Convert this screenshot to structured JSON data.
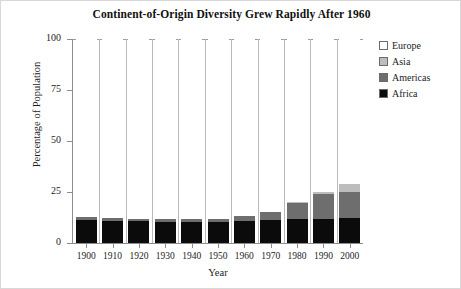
{
  "chart_data": {
    "type": "bar",
    "stacked": true,
    "title": "Continent-of-Origin Diversity Grew Rapidly After 1960",
    "xlabel": "Year",
    "ylabel": "Percentage of Population",
    "categories": [
      "1900",
      "1910",
      "1920",
      "1930",
      "1940",
      "1950",
      "1960",
      "1970",
      "1980",
      "1990",
      "2000"
    ],
    "ylim": [
      0,
      100
    ],
    "yticks": [
      0,
      25,
      50,
      75,
      100
    ],
    "ytick_labels": [
      "0",
      "25",
      "50",
      "75",
      "100"
    ],
    "grid": "vertical",
    "legend_position": "right",
    "series": [
      {
        "name": "Africa",
        "color": "#0b0b0b",
        "values": [
          11.5,
          11.0,
          10.7,
          10.5,
          10.5,
          10.5,
          11.0,
          11.5,
          12.0,
          12.0,
          12.5
        ]
      },
      {
        "name": "Americas",
        "color": "#6e6e6e",
        "values": [
          1.2,
          1.2,
          1.3,
          1.3,
          1.3,
          1.5,
          2.0,
          3.5,
          7.5,
          12.0,
          12.5
        ]
      },
      {
        "name": "Asia",
        "color": "#bdbdbd",
        "values": [
          0.0,
          0.0,
          0.0,
          0.0,
          0.0,
          0.0,
          0.0,
          0.0,
          0.5,
          1.0,
          4.0
        ]
      },
      {
        "name": "Europe",
        "color": "#ffffff",
        "values": [
          87.3,
          87.8,
          88.0,
          88.2,
          88.2,
          88.0,
          87.0,
          85.0,
          80.0,
          75.0,
          71.0
        ]
      }
    ],
    "totals_non_europe": [
      12.7,
      12.2,
      12.0,
      11.8,
      11.8,
      12.0,
      13.0,
      15.0,
      20.0,
      25.0,
      29.0
    ]
  },
  "legend": {
    "items": [
      {
        "label": "Europe",
        "color": "#ffffff"
      },
      {
        "label": "Asia",
        "color": "#bdbdbd"
      },
      {
        "label": "Americas",
        "color": "#6e6e6e"
      },
      {
        "label": "Africa",
        "color": "#0b0b0b"
      }
    ]
  }
}
